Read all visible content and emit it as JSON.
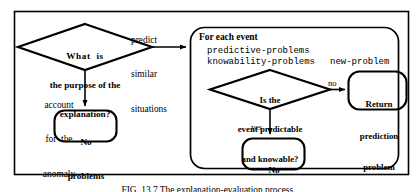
{
  "figure": {
    "caption": "FIG. 13.7  The explanation-evaluation process.",
    "colors": {
      "stroke": "#000000",
      "background": "#ffffff"
    }
  },
  "outer_frame": {
    "name": "diagram-border"
  },
  "nodes": {
    "main_decision": {
      "shape": "diamond",
      "line1": "What  is",
      "line2": "the purpose of the",
      "line3": "explanation?"
    },
    "left_terminal": {
      "shape": "rounded-rect",
      "line1": "No",
      "line2": "problems"
    },
    "inner_decision": {
      "shape": "diamond",
      "line1": "Is the",
      "line2": "event predictable",
      "line3": "and knowable?"
    },
    "return_terminal": {
      "shape": "rounded-rect",
      "line1": "Return",
      "line2": "prediction",
      "line3": "problem"
    },
    "inner_terminal": {
      "shape": "rounded-rect",
      "line1": "No",
      "line2": "problems"
    }
  },
  "panel": {
    "title": "For each event",
    "variables": {
      "predictive": "predictive-problems",
      "knowability": "knowability-problems",
      "new_problem": "new-problem"
    }
  },
  "edges": {
    "predict_similar": {
      "line1": "predict",
      "line2": "similar",
      "line3": "situations"
    },
    "account_anomaly": {
      "line1": "account",
      "line2": "for  the",
      "line3": "anomaly"
    },
    "no": "no",
    "yes": "yes"
  }
}
